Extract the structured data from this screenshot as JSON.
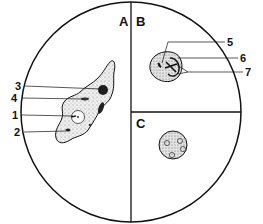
{
  "sections": [
    {
      "id": "A",
      "label": "A",
      "content": "trophozoite (amoeboid cell)"
    },
    {
      "id": "B",
      "label": "B",
      "content": "cell with internal structures"
    },
    {
      "id": "C",
      "label": "C",
      "content": "round cyst with four nuclei"
    }
  ],
  "callouts": [
    {
      "number": "1",
      "section": "A"
    },
    {
      "number": "2",
      "section": "A"
    },
    {
      "number": "3",
      "section": "A"
    },
    {
      "number": "4",
      "section": "A"
    },
    {
      "number": "5",
      "section": "B"
    },
    {
      "number": "6",
      "section": "B"
    },
    {
      "number": "7",
      "section": "B"
    }
  ],
  "colors": {
    "line": "#111111",
    "cytoplasm": "#e4e4e4",
    "dark_body": "#222222",
    "background": "#ffffff"
  }
}
